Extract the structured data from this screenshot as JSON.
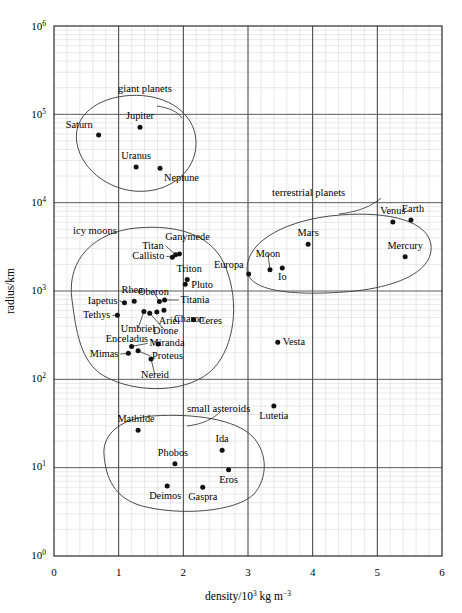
{
  "chart_data": {
    "type": "scatter",
    "title": "",
    "xlabel": "density/10^3 kg m^-3",
    "ylabel": "radius/km",
    "xlabel_parts": {
      "prefix": "density/10",
      "exp1": "3",
      "mid": " kg m",
      "exp2": "−3"
    },
    "ylabel_text": "radius/km",
    "xlim": [
      0,
      6
    ],
    "ylim_log10": [
      0,
      6
    ],
    "xscale": "linear",
    "yscale": "log",
    "grid": "major and minor",
    "legend": "none (inline group annotations)",
    "x_ticks": [
      "0",
      "1",
      "2",
      "3",
      "4",
      "5",
      "6"
    ],
    "y_ticks": [
      {
        "base": "10",
        "exp": "6"
      },
      {
        "base": "10",
        "exp": "5"
      },
      {
        "base": "10",
        "exp": "4"
      },
      {
        "base": "10",
        "exp": "3"
      },
      {
        "base": "10",
        "exp": "2"
      },
      {
        "base": "10",
        "exp": "1"
      },
      {
        "base": "10",
        "exp": "0"
      }
    ],
    "x_minor_step": 0.2,
    "group_annotations": [
      {
        "name": "giant planets",
        "label": "giant planets"
      },
      {
        "name": "terrestrial planets",
        "label": "terrestrial planets"
      },
      {
        "name": "icy moons",
        "label": "icy moons"
      },
      {
        "name": "small asteroids",
        "label": "small asteroids"
      }
    ],
    "points": [
      {
        "label": "Saturn",
        "density": 0.69,
        "radius": 58200,
        "group": "giant planets"
      },
      {
        "label": "Jupiter",
        "density": 1.33,
        "radius": 71500,
        "group": "giant planets"
      },
      {
        "label": "Uranus",
        "density": 1.27,
        "radius": 25400,
        "group": "giant planets"
      },
      {
        "label": "Neptune",
        "density": 1.64,
        "radius": 24600,
        "group": "giant planets"
      },
      {
        "label": "Venus",
        "density": 5.24,
        "radius": 6050,
        "group": "terrestrial planets"
      },
      {
        "label": "Earth",
        "density": 5.52,
        "radius": 6370,
        "group": "terrestrial planets"
      },
      {
        "label": "Mercury",
        "density": 5.43,
        "radius": 2440,
        "group": "terrestrial planets"
      },
      {
        "label": "Mars",
        "density": 3.93,
        "radius": 3390,
        "group": "terrestrial planets"
      },
      {
        "label": "Moon",
        "density": 3.34,
        "radius": 1740,
        "group": "terrestrial planets"
      },
      {
        "label": "Io",
        "density": 3.53,
        "radius": 1820,
        "group": "terrestrial planets"
      },
      {
        "label": "Europa",
        "density": 3.01,
        "radius": 1560,
        "group": "terrestrial planets"
      },
      {
        "label": "Ganymede",
        "density": 1.94,
        "radius": 2630,
        "group": "icy moons"
      },
      {
        "label": "Titan",
        "density": 1.88,
        "radius": 2575,
        "group": "icy moons"
      },
      {
        "label": "Callisto",
        "density": 1.83,
        "radius": 2410,
        "group": "icy moons"
      },
      {
        "label": "Triton",
        "density": 2.06,
        "radius": 1350,
        "group": "icy moons"
      },
      {
        "label": "Pluto",
        "density": 2.03,
        "radius": 1190,
        "group": "icy moons"
      },
      {
        "label": "Oberon",
        "density": 1.63,
        "radius": 760,
        "group": "icy moons"
      },
      {
        "label": "Titania",
        "density": 1.71,
        "radius": 790,
        "group": "icy moons"
      },
      {
        "label": "Charon",
        "density": 1.7,
        "radius": 605,
        "group": "icy moons"
      },
      {
        "label": "Ariel",
        "density": 1.59,
        "radius": 579,
        "group": "icy moons"
      },
      {
        "label": "Ceres",
        "density": 2.16,
        "radius": 473,
        "group": "icy moons"
      },
      {
        "label": "Rhea",
        "density": 1.24,
        "radius": 764,
        "group": "icy moons"
      },
      {
        "label": "Iapetus",
        "density": 1.09,
        "radius": 735,
        "group": "icy moons"
      },
      {
        "label": "Tethys",
        "density": 0.98,
        "radius": 531,
        "group": "icy moons"
      },
      {
        "label": "Umbriel",
        "density": 1.39,
        "radius": 585,
        "group": "icy moons"
      },
      {
        "label": "Dione",
        "density": 1.48,
        "radius": 561,
        "group": "icy moons"
      },
      {
        "label": "Enceladus",
        "density": 1.61,
        "radius": 252,
        "group": "icy moons"
      },
      {
        "label": "Miranda",
        "density": 1.2,
        "radius": 236,
        "group": "icy moons"
      },
      {
        "label": "Mimas",
        "density": 1.15,
        "radius": 198,
        "group": "icy moons"
      },
      {
        "label": "Proteus",
        "density": 1.3,
        "radius": 210,
        "group": "icy moons"
      },
      {
        "label": "Nereid",
        "density": 1.5,
        "radius": 170,
        "group": "icy moons"
      },
      {
        "label": "Vesta",
        "density": 3.46,
        "radius": 263,
        "group": ""
      },
      {
        "label": "Lutetia",
        "density": 3.4,
        "radius": 50,
        "group": ""
      },
      {
        "label": "Mathilde",
        "density": 1.3,
        "radius": 26.5,
        "group": "small asteroids"
      },
      {
        "label": "Ida",
        "density": 2.6,
        "radius": 15.7,
        "group": "small asteroids"
      },
      {
        "label": "Phobos",
        "density": 1.87,
        "radius": 11.1,
        "group": "small asteroids"
      },
      {
        "label": "Eros",
        "density": 2.7,
        "radius": 9.5,
        "group": "small asteroids"
      },
      {
        "label": "Deimos",
        "density": 1.75,
        "radius": 6.2,
        "group": "small asteroids"
      },
      {
        "label": "Gaspra",
        "density": 2.3,
        "radius": 6.0,
        "group": "small asteroids"
      }
    ]
  },
  "labels": {
    "giant_planets": "giant planets",
    "terrestrial_planets": "terrestrial planets",
    "icy_moons": "icy moons",
    "small_asteroids": "small asteroids",
    "Saturn": "Saturn",
    "Jupiter": "Jupiter",
    "Uranus": "Uranus",
    "Neptune": "Neptune",
    "Venus": "Venus",
    "Earth": "Earth",
    "Mercury": "Mercury",
    "Mars": "Mars",
    "Moon": "Moon",
    "Io": "Io",
    "Europa": "Europa",
    "Ganymede": "Ganymede",
    "Titan": "Titan",
    "Callisto": "Callisto",
    "Triton": "Triton",
    "Pluto": "Pluto",
    "Oberon": "Oberon",
    "Titania": "Titania",
    "Charon": "Charon",
    "Ariel": "Ariel",
    "Ceres": "Ceres",
    "Rhea": "Rhea",
    "Iapetus": "Iapetus",
    "Tethys": "Tethys",
    "Umbriel": "Umbriel",
    "Dione": "Dione",
    "Enceladus": "Enceladus",
    "Miranda": "Miranda",
    "Mimas": "Mimas",
    "Proteus": "Proteus",
    "Nereid": "Nereid",
    "Vesta": "Vesta",
    "Lutetia": "Lutetia",
    "Mathilde": "Mathilde",
    "Ida": "Ida",
    "Phobos": "Phobos",
    "Eros": "Eros",
    "Deimos": "Deimos",
    "Gaspra": "Gaspra"
  },
  "axes": {
    "x_title_prefix": "density/10",
    "x_title_exp1": "3",
    "x_title_mid": " kg m",
    "x_title_exp2": "−3",
    "y_title": "radius/km",
    "x_tick_0": "0",
    "x_tick_1": "1",
    "x_tick_2": "2",
    "x_tick_3": "3",
    "x_tick_4": "4",
    "x_tick_5": "5",
    "x_tick_6": "6",
    "y_base": "10",
    "y_exp_6": "6",
    "y_exp_5": "5",
    "y_exp_4": "4",
    "y_exp_3": "3",
    "y_exp_2": "2",
    "y_exp_1": "1",
    "y_exp_0": "0"
  }
}
